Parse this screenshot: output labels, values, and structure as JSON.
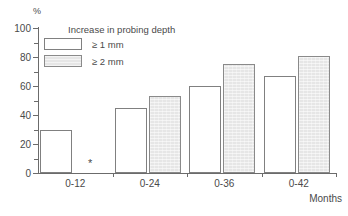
{
  "chart_data": {
    "type": "bar",
    "title": "",
    "subtitle": "",
    "xlabel": "Months",
    "ylabel": "%",
    "categories": [
      "0-12",
      "0-24",
      "0-36",
      "0-42"
    ],
    "series": [
      {
        "name": "≥ 1 mm",
        "values": [
          30,
          45,
          60,
          67
        ]
      },
      {
        "name": "≥ 2 mm",
        "values": [
          null,
          53,
          75,
          81
        ]
      }
    ],
    "legend_title": "Increase in probing depth",
    "legend_position": "top-left-inside",
    "ylim": [
      0,
      100
    ],
    "y_ticks": [
      0,
      20,
      40,
      60,
      80,
      100
    ],
    "y_tick_labels": [
      "0",
      "20",
      "40",
      "60",
      "80",
      "100"
    ],
    "y_minor_ticks": [
      10,
      30,
      50,
      70,
      90
    ],
    "grid": false,
    "annotations": [
      {
        "text": "*",
        "x_category": "0-12",
        "series": "≥ 2 mm",
        "value_note": "no bar plotted"
      }
    ],
    "colors": {
      "series_a_fill": "#ffffff",
      "series_a_border": "#808080",
      "series_b_fill": "#e6e6e6",
      "series_b_border": "#8a8a8a",
      "axis": "#6b6b6b",
      "text": "#4a4a4a",
      "background": "#ffffff"
    }
  }
}
